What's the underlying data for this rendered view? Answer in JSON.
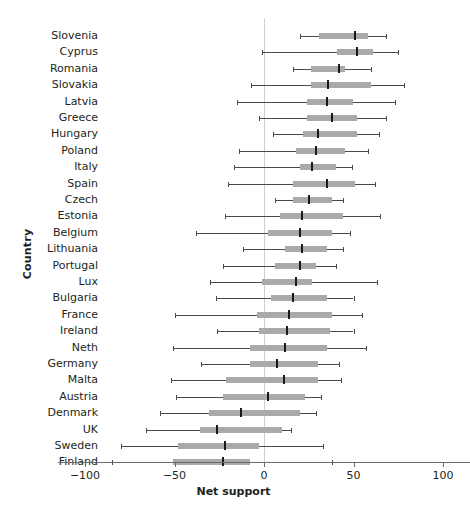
{
  "chart_data": {
    "type": "bar",
    "subtype": "box-whisker-horizontal",
    "title": "",
    "xlabel": "Net support",
    "ylabel": "Country",
    "xlim": [
      -115,
      115
    ],
    "xticks": [
      -100,
      -50,
      0,
      50,
      100
    ],
    "xtick_labels": [
      "−100",
      "−50",
      "0",
      "50",
      "100"
    ],
    "grid": false,
    "zero_reference_line": true,
    "legend": null,
    "categories": [
      "Slovenia",
      "Cyprus",
      "Romania",
      "Slovakia",
      "Latvia",
      "Greece",
      "Hungary",
      "Poland",
      "Italy",
      "Spain",
      "Czech",
      "Estonia",
      "Belgium",
      "Lithuania",
      "Portugal",
      "Lux",
      "Bulgaria",
      "France",
      "Ireland",
      "Neth",
      "Germany",
      "Malta",
      "Austria",
      "Denmark",
      "UK",
      "Sweden",
      "Finland"
    ],
    "series": [
      {
        "name": "Slovenia",
        "low": 20,
        "q1": 31,
        "median": 51,
        "q3": 58,
        "high": 68
      },
      {
        "name": "Cyprus",
        "low": -1,
        "q1": 41,
        "median": 52,
        "q3": 61,
        "high": 75
      },
      {
        "name": "Romania",
        "low": 16,
        "q1": 26,
        "median": 42,
        "q3": 45,
        "high": 60
      },
      {
        "name": "Slovakia",
        "low": -7,
        "q1": 26,
        "median": 36,
        "q3": 60,
        "high": 78
      },
      {
        "name": "Latvia",
        "low": -15,
        "q1": 24,
        "median": 35,
        "q3": 50,
        "high": 73
      },
      {
        "name": "Greece",
        "low": -3,
        "q1": 24,
        "median": 38,
        "q3": 52,
        "high": 68
      },
      {
        "name": "Hungary",
        "low": 5,
        "q1": 22,
        "median": 30,
        "q3": 52,
        "high": 64
      },
      {
        "name": "Poland",
        "low": -14,
        "q1": 18,
        "median": 29,
        "q3": 45,
        "high": 58
      },
      {
        "name": "Italy",
        "low": -17,
        "q1": 20,
        "median": 27,
        "q3": 40,
        "high": 49
      },
      {
        "name": "Spain",
        "low": -20,
        "q1": 16,
        "median": 35,
        "q3": 51,
        "high": 62
      },
      {
        "name": "Czech",
        "low": 6,
        "q1": 16,
        "median": 25,
        "q3": 38,
        "high": 44
      },
      {
        "name": "Estonia",
        "low": -22,
        "q1": 9,
        "median": 21,
        "q3": 44,
        "high": 65
      },
      {
        "name": "Belgium",
        "low": -38,
        "q1": 2,
        "median": 20,
        "q3": 38,
        "high": 48
      },
      {
        "name": "Lithuania",
        "low": -12,
        "q1": 12,
        "median": 21,
        "q3": 35,
        "high": 44
      },
      {
        "name": "Portugal",
        "low": -23,
        "q1": 6,
        "median": 20,
        "q3": 29,
        "high": 40
      },
      {
        "name": "Lux",
        "low": -30,
        "q1": -1,
        "median": 18,
        "q3": 27,
        "high": 63
      },
      {
        "name": "Bulgaria",
        "low": -27,
        "q1": 4,
        "median": 16,
        "q3": 35,
        "high": 50
      },
      {
        "name": "France",
        "low": -50,
        "q1": -4,
        "median": 14,
        "q3": 38,
        "high": 55
      },
      {
        "name": "Ireland",
        "low": -26,
        "q1": -3,
        "median": 13,
        "q3": 37,
        "high": 50
      },
      {
        "name": "Neth",
        "low": -51,
        "q1": -8,
        "median": 12,
        "q3": 35,
        "high": 57
      },
      {
        "name": "Germany",
        "low": -35,
        "q1": -8,
        "median": 7,
        "q3": 30,
        "high": 42
      },
      {
        "name": "Malta",
        "low": -52,
        "q1": -21,
        "median": 11,
        "q3": 30,
        "high": 43
      },
      {
        "name": "Austria",
        "low": -49,
        "q1": -23,
        "median": 2,
        "q3": 23,
        "high": 32
      },
      {
        "name": "Denmark",
        "low": -58,
        "q1": -31,
        "median": -13,
        "q3": 20,
        "high": 29
      },
      {
        "name": "UK",
        "low": -66,
        "q1": -36,
        "median": -26,
        "q3": 10,
        "high": 15
      },
      {
        "name": "Sweden",
        "low": -80,
        "q1": -48,
        "median": -22,
        "q3": -3,
        "high": 33
      },
      {
        "name": "Finland",
        "low": -85,
        "q1": -51,
        "median": -23,
        "q3": -8,
        "high": 38
      }
    ],
    "colors": {
      "box": "#aaaaaa",
      "whisker": "#4a4a4a",
      "median": "#1a1a1a",
      "zero_line": "#cfcfcf",
      "axis": "#6b6b6b",
      "text": "#231f20"
    }
  }
}
